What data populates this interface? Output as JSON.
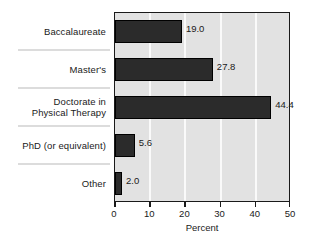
{
  "chart_data": {
    "type": "bar",
    "orientation": "horizontal",
    "title": "",
    "xlabel": "Percent",
    "ylabel": "",
    "categories": [
      "Baccalaureate",
      "Master's",
      "Doctorate in\nPhysical Therapy",
      "PhD (or equivalent)",
      "Other"
    ],
    "values": [
      19.0,
      27.8,
      44.4,
      5.6,
      2.0
    ],
    "value_labels": [
      "19.0",
      "27.8",
      "44.4",
      "5.6",
      "2.0"
    ],
    "xlim": [
      0,
      50
    ],
    "xticks": [
      0,
      10,
      20,
      30,
      40,
      50
    ],
    "xtick_labels": [
      "0",
      "10",
      "20",
      "30",
      "40",
      "50"
    ],
    "grid": "vertical",
    "legend": null,
    "colors": {
      "bar_fill": "#2b2b2b",
      "bar_border": "#000000",
      "plot_background": "#e2e2e2",
      "gridline": "#fafafa",
      "frame": "#1a1a1a",
      "text": "#1a1a1a",
      "separator": "#dcdcdc",
      "page_background": "#ffffff"
    }
  }
}
